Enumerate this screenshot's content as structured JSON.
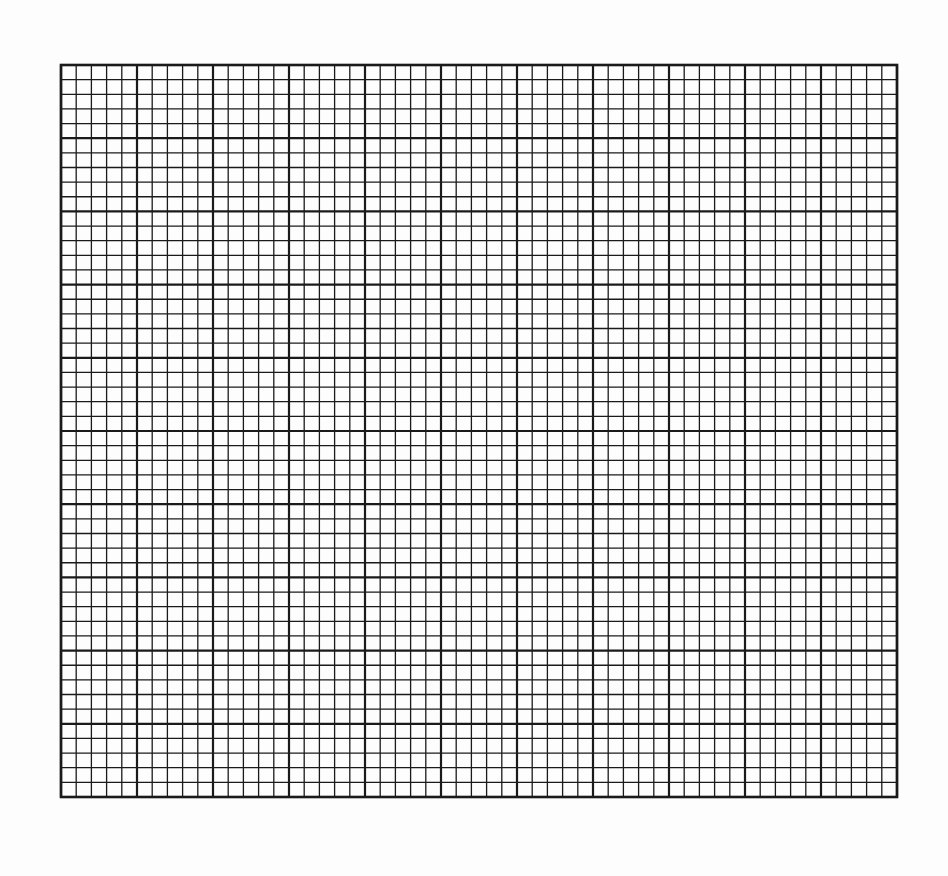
{
  "page": {
    "type": "graph-paper",
    "background_color": "#fdfdfd",
    "line_color": "#1a1a1a"
  },
  "grid": {
    "left": 61,
    "top": 65,
    "right": 897,
    "bottom": 797,
    "major_columns": 11,
    "major_rows": 10,
    "minor_divisions_per_major": 5,
    "major_line_width": 2.2,
    "minor_line_width": 1.3
  }
}
